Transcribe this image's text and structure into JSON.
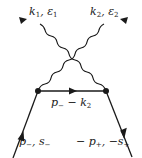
{
  "diagram": {
    "type": "feynman-diagram",
    "colors": {
      "line": "#1a1a1a",
      "background": "#ffffff"
    },
    "labels": {
      "photon1": {
        "momentum": "k",
        "momentum_sub": "1",
        "sep": ", ",
        "polarization": "ε",
        "polarization_sub": "1"
      },
      "photon2": {
        "momentum": "k",
        "momentum_sub": "2",
        "sep": ", ",
        "polarization": "ε",
        "polarization_sub": "2"
      },
      "propagator": {
        "p": "p",
        "p_sub": "−",
        "minus": " − ",
        "k": "k",
        "k_sub": "2"
      },
      "electron": {
        "p": "p",
        "p_sub": "−",
        "sep": ", ",
        "s": "s",
        "s_sub": "−"
      },
      "positron": {
        "neg1": "− ",
        "p": "p",
        "p_sub": "+",
        "sep": ", −",
        "s": "s",
        "s_sub": "+"
      }
    },
    "vertices": [
      {
        "name": "left-vertex",
        "x": 38,
        "y": 91
      },
      {
        "name": "right-vertex",
        "x": 106,
        "y": 91
      }
    ],
    "lines": [
      {
        "name": "incoming-electron",
        "kind": "fermion",
        "from": [
          13,
          158
        ],
        "to": [
          38,
          91
        ],
        "arrow": "up"
      },
      {
        "name": "internal-propagator",
        "kind": "fermion",
        "from": [
          38,
          91
        ],
        "to": [
          106,
          91
        ],
        "arrow": "right"
      },
      {
        "name": "incoming-positron",
        "kind": "fermion",
        "from": [
          106,
          91
        ],
        "to": [
          132,
          157
        ],
        "arrow": "down"
      },
      {
        "name": "photon-k1",
        "kind": "photon",
        "from": [
          106,
          91
        ],
        "to": [
          20,
          18
        ],
        "arrow": "out"
      },
      {
        "name": "photon-k2",
        "kind": "photon",
        "from": [
          38,
          91
        ],
        "to": [
          127,
          18
        ],
        "arrow": "out"
      }
    ]
  }
}
